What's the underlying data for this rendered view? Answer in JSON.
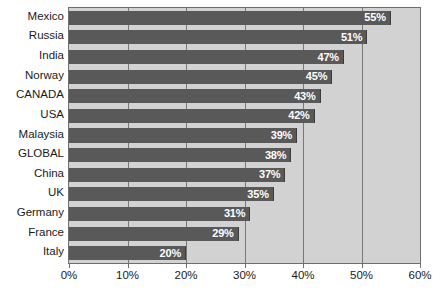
{
  "chart_data": {
    "type": "bar",
    "orientation": "horizontal",
    "title": "",
    "subtitle": "",
    "xlabel": "",
    "ylabel": "",
    "xlim": [
      0,
      60
    ],
    "grid": true,
    "legend": false,
    "xtick_labels": [
      "0%",
      "10%",
      "20%",
      "30%",
      "40%",
      "50%",
      "60%"
    ],
    "xticks": [
      0,
      10,
      20,
      30,
      40,
      50,
      60
    ],
    "categories": [
      "Mexico",
      "Russia",
      "India",
      "Norway",
      "CANADA",
      "USA",
      "Malaysia",
      "GLOBAL",
      "China",
      "UK",
      "Germany",
      "France",
      "Italy"
    ],
    "values": [
      55,
      51,
      47,
      45,
      43,
      42,
      39,
      38,
      37,
      35,
      31,
      29,
      20
    ],
    "value_labels": [
      "55%",
      "51%",
      "47%",
      "45%",
      "43%",
      "42%",
      "39%",
      "38%",
      "37%",
      "35%",
      "31%",
      "29%",
      "20%"
    ],
    "colors": {
      "bar": "#595959",
      "bar_edge": "#3c3c3c",
      "plot_background": "#d2d2d2",
      "gridline": "#787878",
      "axis_border": "#6e6e6e",
      "value_text": "#ffffff",
      "tick_text": "#1a1a1a",
      "figure_background": "#ffffff"
    }
  }
}
